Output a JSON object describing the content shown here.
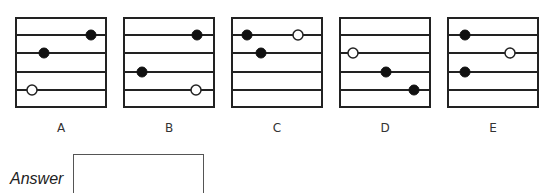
{
  "puzzle": {
    "line_count": 4,
    "panels": [
      {
        "label": "A",
        "left": 15,
        "dots": [
          {
            "line": 1,
            "x": 76,
            "type": "filled"
          },
          {
            "line": 2,
            "x": 29,
            "type": "filled"
          },
          {
            "line": 4,
            "x": 17,
            "type": "open"
          }
        ]
      },
      {
        "label": "B",
        "left": 123,
        "dots": [
          {
            "line": 1,
            "x": 74,
            "type": "filled"
          },
          {
            "line": 3,
            "x": 19,
            "type": "filled"
          },
          {
            "line": 4,
            "x": 73,
            "type": "open"
          }
        ]
      },
      {
        "label": "C",
        "left": 231,
        "dots": [
          {
            "line": 1,
            "x": 16,
            "type": "filled"
          },
          {
            "line": 1,
            "x": 67,
            "type": "open"
          },
          {
            "line": 2,
            "x": 30,
            "type": "filled"
          }
        ]
      },
      {
        "label": "D",
        "left": 339,
        "dots": [
          {
            "line": 2,
            "x": 14,
            "type": "open"
          },
          {
            "line": 3,
            "x": 47,
            "type": "filled"
          },
          {
            "line": 4,
            "x": 75,
            "type": "filled"
          }
        ]
      },
      {
        "label": "E",
        "left": 447,
        "dots": [
          {
            "line": 1,
            "x": 18,
            "type": "filled"
          },
          {
            "line": 2,
            "x": 63,
            "type": "open"
          },
          {
            "line": 3,
            "x": 18,
            "type": "filled"
          }
        ]
      }
    ]
  },
  "answer": {
    "label": "Answer",
    "value": ""
  }
}
